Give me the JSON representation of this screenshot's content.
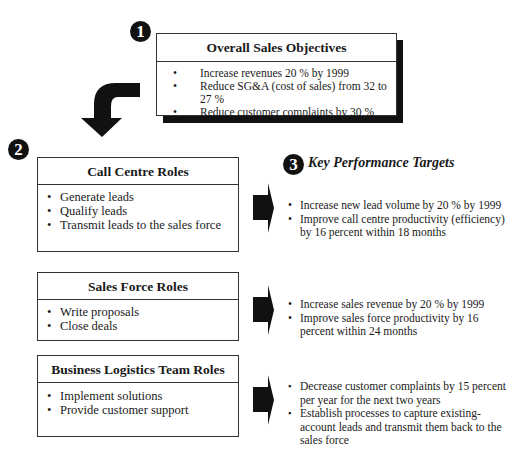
{
  "objectives": {
    "badge": "1",
    "title": "Overall Sales Objectives",
    "items": [
      "Increase revenues 20 % by 1999",
      "Reduce SG&A (cost of sales) from 32 to 27 %",
      "Reduce customer complaints by 30 %"
    ]
  },
  "roles_section": {
    "badge": "2"
  },
  "kpt_section": {
    "badge": "3",
    "title": "Key Performance Targets"
  },
  "roles": [
    {
      "title": "Call Centre Roles",
      "items": [
        "Generate leads",
        "Qualify leads",
        "Transmit leads to the sales force"
      ],
      "targets": [
        "Increase new lead volume  by 20 % by 1999",
        "Improve call centre productivity (efficiency) by 16 percent within 18 months"
      ]
    },
    {
      "title": "Sales Force Roles",
      "items": [
        "Write proposals",
        "Close deals"
      ],
      "targets": [
        "Increase sales revenue by 20 % by 1999",
        "Improve sales force productivity by 16 percent within 24 months"
      ]
    },
    {
      "title": "Business Logistics Team Roles",
      "items": [
        "Implement solutions",
        "Provide customer support"
      ],
      "targets": [
        "Decrease customer complaints by 15 percent per year for the next two years",
        "Establish processes to capture existing-account leads and transmit them back to the sales force"
      ]
    }
  ],
  "icons": {
    "curved_arrow": "curved-down-arrow-icon",
    "right_arrow": "right-block-arrow-icon"
  },
  "colors": {
    "ink": "#111111",
    "border": "#333333",
    "background": "#ffffff"
  }
}
